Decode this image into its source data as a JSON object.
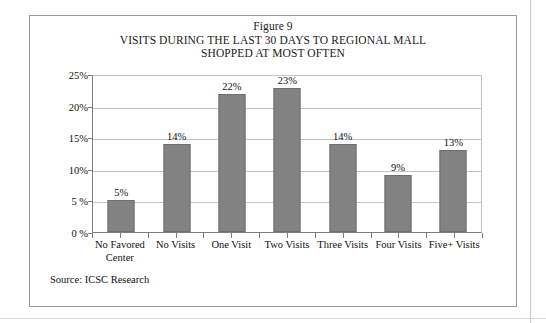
{
  "figure": {
    "title_line1": "Figure 9",
    "title_line2": "VISITS DURING THE LAST 30 DAYS TO REGIONAL MALL",
    "title_line3": "SHOPPED AT MOST OFTEN",
    "source": "Source: ICSC Research",
    "frame_color": "#9a9a9a",
    "bar_color": "#828282",
    "gridline_color": "#c4c4c4",
    "axis_color": "#7d7d7d"
  },
  "chart_data": {
    "type": "bar",
    "xlabel": "",
    "ylabel": "",
    "ylim": [
      0,
      25
    ],
    "ytick_labels": [
      "25%",
      "20%",
      "15%",
      "10%",
      "5 %",
      "0 %"
    ],
    "ytick_values": [
      25,
      20,
      15,
      10,
      5,
      0
    ],
    "grid": true,
    "legend": false,
    "categories": [
      "No Favored Center",
      "No Visits",
      "One Visit",
      "Two Visits",
      "Three Visits",
      "Four Visits",
      "Five+ Visits"
    ],
    "category_lines": [
      [
        "No Favored",
        "Center"
      ],
      [
        "No Visits"
      ],
      [
        "One Visit"
      ],
      [
        "Two Visits"
      ],
      [
        "Three Visits"
      ],
      [
        "Four Visits"
      ],
      [
        "Five+ Visits"
      ]
    ],
    "values": [
      5,
      14,
      22,
      23,
      14,
      9,
      13
    ],
    "data_labels": [
      "5%",
      "14%",
      "22%",
      "23%",
      "14%",
      "9%",
      "13%"
    ]
  }
}
